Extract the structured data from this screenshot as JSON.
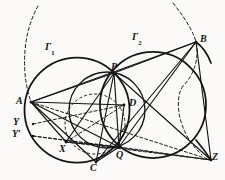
{
  "figure": {
    "background_color": "#fbfaf8",
    "stroke_color": "#141414",
    "width": 225,
    "height": 180
  },
  "labels": {
    "gamma1": "Γ",
    "gamma1_sub": "1",
    "gamma2": "Γ",
    "gamma2_sub": "2",
    "A": "A",
    "B": "B",
    "C": "C",
    "D": "D",
    "P": "P",
    "Q": "Q",
    "X": "X",
    "Y": "Y",
    "Yprime": "Y",
    "Yprime_mark": "′",
    "Z": "Z"
  },
  "points": {
    "A": {
      "x": 31,
      "y": 102,
      "label_x": 16,
      "label_y": 96
    },
    "B": {
      "x": 196,
      "y": 42,
      "label_x": 200,
      "label_y": 34
    },
    "C": {
      "x": 96,
      "y": 162,
      "label_x": 90,
      "label_y": 163
    },
    "D": {
      "x": 124,
      "y": 105,
      "label_x": 129,
      "label_y": 98
    },
    "P": {
      "x": 114,
      "y": 73,
      "label_x": 111,
      "label_y": 62
    },
    "Q": {
      "x": 119,
      "y": 147,
      "label_x": 116,
      "label_y": 150
    },
    "X": {
      "x": 66,
      "y": 142,
      "label_x": 59,
      "label_y": 144
    },
    "Y": {
      "x": 33,
      "y": 124,
      "label_x": 13,
      "label_y": 117
    },
    "Yp": {
      "x": 33,
      "y": 136,
      "label_x": 12,
      "label_y": 129
    },
    "Z": {
      "x": 211,
      "y": 160,
      "label_x": 212,
      "label_y": 152
    }
  },
  "curve_labels": {
    "gamma1": {
      "label_x": 45,
      "label_y": 42
    },
    "gamma2": {
      "label_x": 132,
      "label_y": 32
    }
  },
  "circles": [
    {
      "name": "gamma-1",
      "cx": 77,
      "cy": 110,
      "r": 52.5,
      "style": "solid",
      "width": 1.7
    },
    {
      "name": "gamma-2",
      "cx": 153,
      "cy": 105,
      "r": 53.0,
      "style": "solid",
      "width": 1.7
    },
    {
      "name": "circle-pdq",
      "cx": 107,
      "cy": 110,
      "r": 38.0,
      "style": "solid",
      "width": 1.4
    },
    {
      "name": "circle-xdq",
      "cx": 95,
      "cy": 124,
      "r": 30.0,
      "style": "dashed",
      "width": 1.0
    },
    {
      "name": "arc-left-big",
      "cx": 118,
      "cy": 116,
      "r": 93.0,
      "style": "dashed",
      "width": 1.0
    },
    {
      "name": "arc-right-big",
      "cx": 108,
      "cy": 100,
      "r": 96.0,
      "style": "dashed",
      "width": 1.0
    }
  ],
  "segments": [
    {
      "name": "A-P",
      "from": "A",
      "to": "P",
      "style": "solid"
    },
    {
      "name": "A-B",
      "from": "A",
      "to": "B",
      "style": "solid"
    },
    {
      "name": "A-D",
      "from": "A",
      "to": "D",
      "style": "solid"
    },
    {
      "name": "A-Q",
      "from": "A",
      "to": "Q",
      "style": "solid"
    },
    {
      "name": "A-C",
      "from": "A",
      "to": "C",
      "style": "solid"
    },
    {
      "name": "A-X",
      "from": "A",
      "to": "X",
      "style": "solid"
    },
    {
      "name": "A-Z",
      "from": "A",
      "to": "Z",
      "style": "dashed"
    },
    {
      "name": "P-B",
      "from": "P",
      "to": "B",
      "style": "solid"
    },
    {
      "name": "P-Q",
      "from": "P",
      "to": "Q",
      "style": "solid"
    },
    {
      "name": "P-C",
      "from": "P",
      "to": "C",
      "style": "solid"
    },
    {
      "name": "P-X",
      "from": "P",
      "to": "X",
      "style": "solid"
    },
    {
      "name": "P-Z",
      "from": "P",
      "to": "Z",
      "style": "solid"
    },
    {
      "name": "B-Q",
      "from": "B",
      "to": "Q",
      "style": "solid"
    },
    {
      "name": "B-C",
      "from": "B",
      "to": "C",
      "style": "solid"
    },
    {
      "name": "B-Z",
      "from": "B",
      "to": "Z",
      "style": "solid"
    },
    {
      "name": "Q-Z",
      "from": "Q",
      "to": "Z",
      "style": "dashed"
    },
    {
      "name": "X-Z",
      "from": "X",
      "to": "Z",
      "style": "dashed"
    },
    {
      "name": "X-D",
      "from": "X",
      "to": "D",
      "style": "dashed"
    },
    {
      "name": "X-Q",
      "from": "X",
      "to": "Q",
      "style": "solid"
    },
    {
      "name": "Y-D",
      "from": "Y",
      "to": "D",
      "style": "dashed"
    },
    {
      "name": "Yp-Q",
      "from": "Yp",
      "to": "Q",
      "style": "dashed"
    },
    {
      "name": "Yp-Z",
      "from": "Yp",
      "to": "Z",
      "style": "dashed"
    },
    {
      "name": "C-Q",
      "from": "C",
      "to": "Q",
      "style": "solid"
    },
    {
      "name": "D-Q",
      "from": "D",
      "to": "Q",
      "style": "solid"
    }
  ]
}
